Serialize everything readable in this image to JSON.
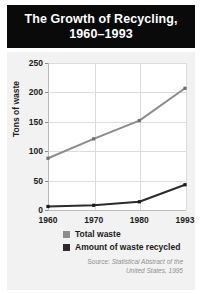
{
  "title": {
    "line1": "The Growth of Recycling,",
    "line2": "1960–1993"
  },
  "source": {
    "prefix": "Source:",
    "line1": "Statistical Abstract of the",
    "line2": "United States, 1995"
  },
  "colors": {
    "banner_background": "#0a0a0a",
    "banner_text": "#ffffff",
    "panel_background": "#f2f2f2",
    "plot_background": "#ffffff",
    "gridline": "#dcdcdc",
    "axis": "#b9b9b9",
    "total_waste_series": "#8c8c8c",
    "recycled_series": "#2b2b2b",
    "source_text": "#909090"
  },
  "chart_data": {
    "type": "line",
    "title": "The Growth of Recycling, 1960–1993",
    "xlabel": "",
    "ylabel": "Tons of waste",
    "x": [
      1960,
      1970,
      1980,
      1993
    ],
    "xticklabels": [
      "1960",
      "1970",
      "1980",
      "1993"
    ],
    "yticks": [
      0,
      50,
      100,
      150,
      200,
      250
    ],
    "yticklabels": [
      "0",
      "50",
      "100",
      "150",
      "200",
      "250"
    ],
    "ylim": [
      0,
      250
    ],
    "grid": true,
    "legend_position": "below-plot",
    "series": [
      {
        "name": "Total waste",
        "color": "#8c8c8c",
        "values": [
          88,
          121,
          152,
          207
        ]
      },
      {
        "name": "Amount of waste recycled",
        "color": "#2b2b2b",
        "values": [
          6,
          8,
          14,
          43
        ]
      }
    ]
  }
}
